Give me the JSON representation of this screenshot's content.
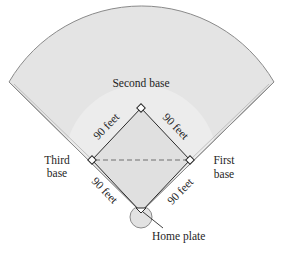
{
  "diagram": {
    "type": "baseball-diamond",
    "colors": {
      "background": "#ffffff",
      "outfield": "#e4e4e4",
      "infield_arc": "#ececec",
      "infield_square": "#e0e0e0",
      "outline": "#8a8a8a",
      "line": "#2a2a2a",
      "dashed": "#6e6e6e"
    },
    "labels": {
      "second_base": "Second base",
      "third_base_line1": "Third",
      "third_base_line2": "base",
      "first_base_line1": "First",
      "first_base_line2": "base",
      "home_plate": "Home plate",
      "side_home_third": "90 feet",
      "side_third_second": "90 feet",
      "side_second_first": "90 feet",
      "side_first_home": "90 feet"
    },
    "points": {
      "home": [
        141,
        212
      ],
      "first": [
        190,
        160
      ],
      "second": [
        141,
        108
      ],
      "third": [
        92,
        160
      ]
    }
  }
}
